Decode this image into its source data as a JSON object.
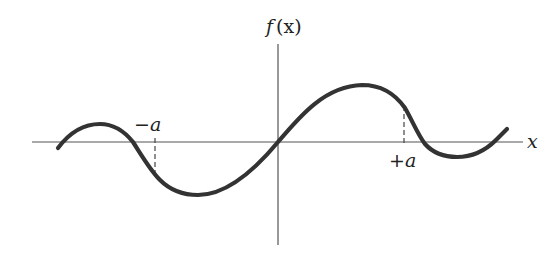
{
  "diagram": {
    "y_axis_label": "f (x)",
    "y_axis_label_f": "f",
    "y_axis_label_arg": "(x)",
    "x_axis_label": "x",
    "marker_left_label": "−a",
    "marker_right_label": "+a",
    "curve_description": "odd oscillating function crossing origin, with dashed markers at x = -a and x = +a",
    "colors": {
      "curve": "#333333",
      "axes": "#555555",
      "text": "#222222",
      "background": "#ffffff"
    }
  }
}
